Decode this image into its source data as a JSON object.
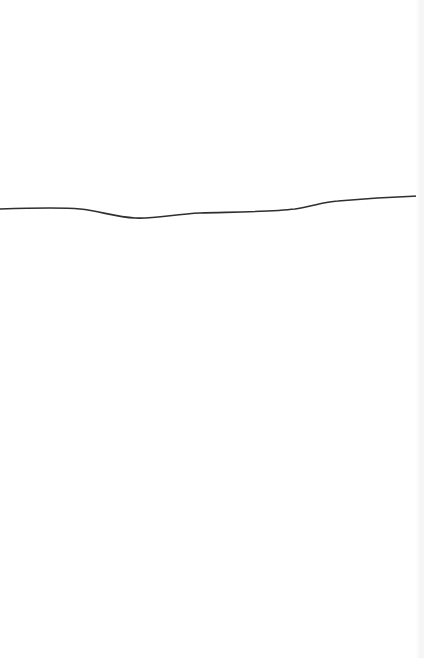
{
  "page": {
    "background": "#ffffff",
    "edge_shade": "#f4f4f4"
  },
  "drawing": {
    "stroke_color": "#2f2f2f",
    "stroke_width": 1.6,
    "path": "M 0 209 C 30 208, 60 207, 80 209 C 100 211, 115 217, 135 218 C 155 219, 175 214, 200 213 C 230 212, 270 212, 295 209 C 315 206, 322 202, 338 201 C 360 199, 390 197, 418 196"
  }
}
